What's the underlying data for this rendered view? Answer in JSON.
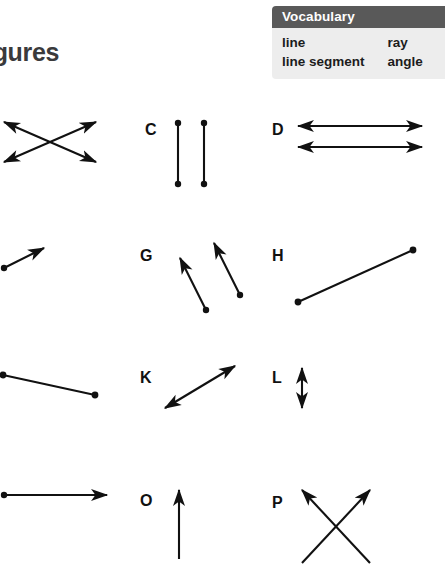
{
  "page": {
    "title": "igures"
  },
  "vocabulary": {
    "header": "Vocabulary",
    "rows": [
      {
        "col_a": "line",
        "col_b": "ray"
      },
      {
        "col_a": "line segment",
        "col_b": "angle"
      }
    ]
  },
  "figures": [
    {
      "label": "",
      "name": "figure-b-intersecting-lines",
      "description": "two intersecting lines forming an X, arrowheads on all four ends",
      "type": "intersecting-lines"
    },
    {
      "label": "C",
      "name": "figure-c-parallel-segments",
      "description": "two vertical parallel line segments with endpoint dots",
      "type": "parallel-segments"
    },
    {
      "label": "D",
      "name": "figure-d-parallel-lines",
      "description": "two horizontal parallel lines with arrowheads on both ends",
      "type": "parallel-lines"
    },
    {
      "label": "",
      "name": "figure-f-ray",
      "description": "single ray with endpoint dot at lower left and arrowhead at upper right",
      "type": "ray"
    },
    {
      "label": "G",
      "name": "figure-g-parallel-rays",
      "description": "two parallel rays with endpoint dots at lower right and arrowheads at upper left",
      "type": "parallel-rays"
    },
    {
      "label": "H",
      "name": "figure-h-line-segment",
      "description": "single line segment with dots at both endpoints",
      "type": "line-segment"
    },
    {
      "label": "",
      "name": "figure-j-line-segment",
      "description": "single line segment with dots at both endpoints sloping down to the right",
      "type": "line-segment"
    },
    {
      "label": "K",
      "name": "figure-k-line",
      "description": "single line with arrowheads at both ends sloping up to the right",
      "type": "line"
    },
    {
      "label": "L",
      "name": "figure-l-vertical-line",
      "description": "short vertical line with arrowheads at both ends",
      "type": "line"
    },
    {
      "label": "",
      "name": "figure-n-ray",
      "description": "horizontal ray with endpoint dot at left and arrowhead at right",
      "type": "ray"
    },
    {
      "label": "O",
      "name": "figure-o-ray",
      "description": "vertical ray pointing upward",
      "type": "ray"
    },
    {
      "label": "P",
      "name": "figure-p-angle",
      "description": "two intersecting lines forming an X with arrowheads pointing up-left and up-right",
      "type": "angle"
    }
  ]
}
